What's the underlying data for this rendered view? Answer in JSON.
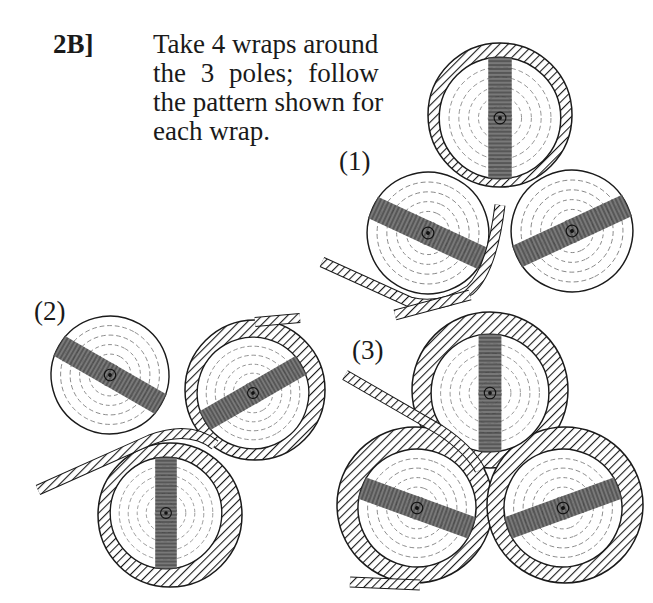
{
  "instruction": {
    "step": "2B]",
    "lines": [
      "Take 4 wraps around",
      "the 3 poles; follow",
      "the pattern shown for",
      "each wrap."
    ]
  },
  "figures": [
    {
      "label": "(1)",
      "description": "Three poles seen end-on, rope wrapped around top pole, entering lower-left"
    },
    {
      "label": "(2)",
      "description": "Three poles, rope wrapped around right and bottom poles, entering left"
    },
    {
      "label": "(3)",
      "description": "Three poles, rope wrapped around all three poles, entering upper-left"
    }
  ],
  "colors": {
    "ink": "#1a1a1a",
    "band": "#555555",
    "paper": "#ffffff"
  }
}
